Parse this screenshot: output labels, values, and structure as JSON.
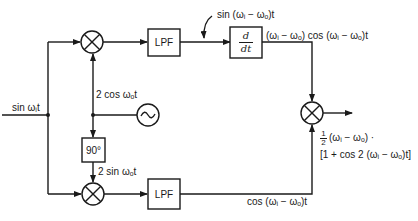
{
  "diagram": {
    "type": "block-diagram",
    "input": {
      "label": "sin ωᵢt"
    },
    "oscillator": {
      "icon": "sine-wave-icon",
      "output_label": "2 cos ωₒt"
    },
    "phase_shifter": {
      "label": "90°",
      "output_label": "2 sin ωₒt"
    },
    "top_branch": {
      "mixer_icon": "multiplier-icon",
      "lpf_label": "LPF",
      "lpf_output_label": "sin (ωᵢ − ωₒ)t",
      "differentiator": {
        "numerator": "d",
        "denominator": "dt"
      },
      "diff_output_label": "(ωᵢ − ωₒ)  cos (ωᵢ − ωₒ)t"
    },
    "bottom_branch": {
      "mixer_icon": "multiplier-icon",
      "lpf_label": "LPF",
      "lpf_output_label": "cos (ωᵢ − ωₒ)t"
    },
    "output": {
      "mixer_icon": "multiplier-icon",
      "line1_frac_num": "1",
      "line1_frac_den": "2",
      "line1_rest": "(ωᵢ − ωₒ) ·",
      "line2": "[1 + cos 2 (ωᵢ − ωₒ)t]"
    }
  }
}
